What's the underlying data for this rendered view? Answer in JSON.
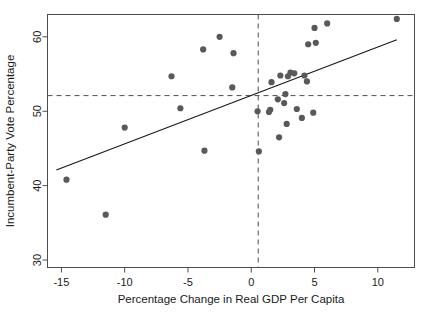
{
  "chart_data": {
    "type": "scatter",
    "title": "",
    "xlabel": "Percentage Change in Real GDP Per Capita",
    "ylabel": "Incumbent-Party Vote Percentage",
    "xlim": [
      -16.1,
      12.9
    ],
    "ylim": [
      29.0,
      63.0
    ],
    "xticks": [
      -15,
      -10,
      -5,
      0,
      5,
      10
    ],
    "xtick_labels": [
      "-15",
      "-10",
      "-5",
      "0",
      "5",
      "10"
    ],
    "yticks": [
      30,
      40,
      50,
      60
    ],
    "ytick_labels": [
      "30",
      "40",
      "50",
      "60"
    ],
    "grid": false,
    "legend": "none",
    "point_color": "#595959",
    "line_color": "#1a1a1a",
    "reference_line_color": "#4d4d4d",
    "frame_color": "#4d4d4d",
    "reference_lines": {
      "vertical_x": 0.55,
      "horizontal_y": 52.1,
      "style": "dashed"
    },
    "fit_line": {
      "style": "solid",
      "x_start": -15.4,
      "y_start": 42.1,
      "x_end": 11.5,
      "y_end": 59.6
    },
    "x": [
      -14.6,
      -11.5,
      -10.0,
      -6.3,
      -5.6,
      -3.8,
      -3.7,
      -2.5,
      -1.5,
      -1.4,
      0.5,
      0.6,
      1.4,
      1.5,
      1.6,
      2.1,
      2.2,
      2.3,
      2.6,
      2.7,
      2.8,
      2.9,
      3.1,
      3.4,
      3.6,
      4.0,
      4.2,
      4.4,
      4.5,
      4.9,
      5.0,
      5.1,
      6.0,
      11.5
    ],
    "y": [
      40.8,
      36.1,
      47.8,
      54.7,
      50.4,
      58.3,
      44.7,
      60.0,
      53.2,
      57.8,
      50.0,
      44.6,
      49.9,
      50.2,
      53.9,
      51.6,
      46.5,
      54.8,
      51.1,
      52.3,
      48.3,
      54.7,
      55.2,
      55.1,
      50.3,
      49.1,
      54.8,
      54.0,
      59.0,
      49.8,
      61.2,
      59.2,
      61.8,
      62.4
    ],
    "n_points": 34
  }
}
